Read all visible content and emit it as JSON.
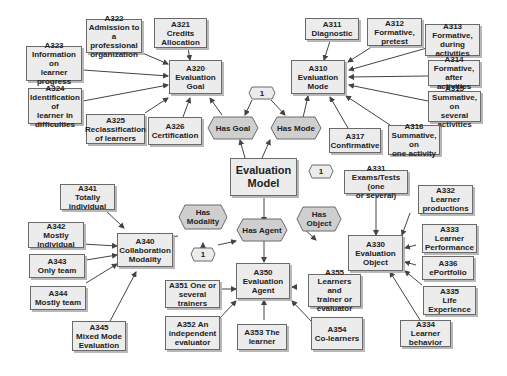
{
  "colors": {
    "box_fill": "#ececec",
    "hex_fill": "#cfcfcf",
    "stroke": "#6a6a6a",
    "line": "#444444"
  },
  "center": {
    "id": "evaluation-model",
    "label": "Evaluation\nModel"
  },
  "relations": {
    "has_goal": "Has Goal",
    "has_mode": "Has Mode",
    "has_modality": "Has\nModality",
    "has_agent": "Has Agent",
    "has_object": "Has\nObject",
    "card_top": "1",
    "card_object": "1",
    "card_modality": "1"
  },
  "goal": {
    "main": "A320\nEvaluation\nGoal",
    "items": [
      "A321\nCredits\nAllocation",
      "A322\nAdmission to a\nprofessional\norganization",
      "A323\nInformation on\nlearner\nprogress",
      "A324\nIdentification of\nlearner in\ndifficulties",
      "A325\nReclassification\nof learners",
      "A326\nCertification"
    ]
  },
  "mode": {
    "main": "A310\nEvaluation\nMode",
    "items": [
      "A311\nDiagnostic",
      "A312\nFormative,\npretest",
      "A313\nFormative,\nduring activities",
      "A314\nFormative, after\nactivities",
      "A315\nSummative, on\nseveral\nactivities",
      "A316\nSummative, on\none activity",
      "A317\nConfirmative"
    ]
  },
  "modality": {
    "main": "A340\nCollaboration\nModality",
    "items": [
      "A341\nTotally\nindividual",
      "A342\nMostly\nindividual",
      "A343\nOnly team",
      "A344\nMostly team",
      "A345\nMixed Mode\nEvaluation"
    ]
  },
  "agent": {
    "main": "A350\nEvaluation\nAgent",
    "items": [
      "A351  One or\nseveral\ntrainers",
      "A352  An\nindependent\nevaluator",
      "A353  The\nlearner",
      "A354\nCo-learners",
      "A355\nLearners and\ntrainer or\nevaluator"
    ]
  },
  "object": {
    "main": "A330\nEvaluation\nObject",
    "items": [
      "A331\nExams/Tests (one\nor several)",
      "A332\nLearner\nproductions",
      "A333\nLearner\nPerformance",
      "A334\nLearner\nbehavior",
      "A335\nLife\nExperience",
      "A336\nePortfolio"
    ]
  }
}
